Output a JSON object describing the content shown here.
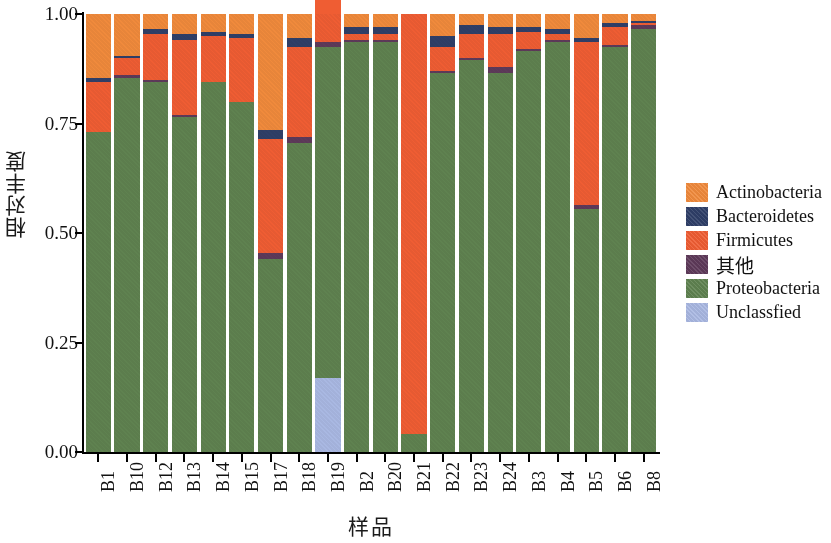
{
  "chart_data": {
    "type": "bar",
    "subtype": "stacked-bar-100pct",
    "title": "",
    "xlabel": "样品",
    "ylabel": "相对丰度",
    "ylim": [
      0,
      1
    ],
    "ytick_labels": [
      "0.00",
      "0.25",
      "0.50",
      "0.75",
      "1.00"
    ],
    "ytick_values": [
      0,
      0.25,
      0.5,
      0.75,
      1.0
    ],
    "grid": false,
    "legend_position": "right",
    "stack_order_bottom_to_top": [
      "Unclassfied",
      "Proteobacteria",
      "其他",
      "Firmicutes",
      "Bacteroidetes",
      "Actinobacteria"
    ],
    "categories": [
      "B1",
      "B10",
      "B12",
      "B13",
      "B14",
      "B15",
      "B17",
      "B18",
      "B19",
      "B2",
      "B20",
      "B21",
      "B22",
      "B23",
      "B24",
      "B3",
      "B4",
      "B5",
      "B6",
      "B8"
    ],
    "series": [
      {
        "name": "Unclassfied",
        "color": "#a9b8e2",
        "values": [
          0,
          0,
          0,
          0,
          0,
          0,
          0,
          0,
          0.17,
          0,
          0,
          0,
          0,
          0,
          0,
          0,
          0,
          0,
          0,
          0
        ]
      },
      {
        "name": "Proteobacteria",
        "color": "#5f8250",
        "values": [
          0.73,
          0.855,
          0.845,
          0.765,
          0.845,
          0.8,
          0.44,
          0.705,
          0.755,
          0.935,
          0.935,
          0.04,
          0.865,
          0.895,
          0.865,
          0.915,
          0.935,
          0.555,
          0.925,
          0.965
        ]
      },
      {
        "name": "其他",
        "color": "#5e3a5a",
        "values": [
          0,
          0.005,
          0.005,
          0.005,
          0,
          0,
          0.015,
          0.015,
          0.01,
          0.005,
          0.005,
          0,
          0.005,
          0.005,
          0.015,
          0.005,
          0.005,
          0.01,
          0.005,
          0.01
        ]
      },
      {
        "name": "Firmicutes",
        "color": "#ef5d33",
        "values": [
          0.115,
          0.04,
          0.105,
          0.17,
          0.105,
          0.145,
          0.26,
          0.205,
          0.195,
          0.015,
          0.015,
          0.96,
          0.055,
          0.055,
          0.075,
          0.04,
          0.015,
          0.37,
          0.04,
          0.005
        ]
      },
      {
        "name": "Bacteroidetes",
        "color": "#2f3f68",
        "values": [
          0.01,
          0.005,
          0.01,
          0.015,
          0.01,
          0.01,
          0.02,
          0.02,
          0.01,
          0.015,
          0.015,
          0,
          0.025,
          0.02,
          0.015,
          0.01,
          0.01,
          0.01,
          0.01,
          0.005
        ]
      },
      {
        "name": "Actinobacteria",
        "color": "#f08a3c",
        "values": [
          0.145,
          0.095,
          0.035,
          0.045,
          0.04,
          0.045,
          0.265,
          0.055,
          0.06,
          0.03,
          0.03,
          0,
          0.05,
          0.025,
          0.03,
          0.03,
          0.035,
          0.055,
          0.02,
          0.015
        ]
      }
    ]
  },
  "legend": {
    "items": [
      {
        "label": "Actinobacteria",
        "color": "#f08a3c",
        "cjk": false
      },
      {
        "label": "Bacteroidetes",
        "color": "#2f3f68",
        "cjk": false
      },
      {
        "label": "Firmicutes",
        "color": "#ef5d33",
        "cjk": false
      },
      {
        "label": "其他",
        "color": "#5e3a5a",
        "cjk": true
      },
      {
        "label": "Proteobacteria",
        "color": "#5f8250",
        "cjk": false
      },
      {
        "label": "Unclassfied",
        "color": "#a9b8e2",
        "cjk": false
      }
    ]
  }
}
